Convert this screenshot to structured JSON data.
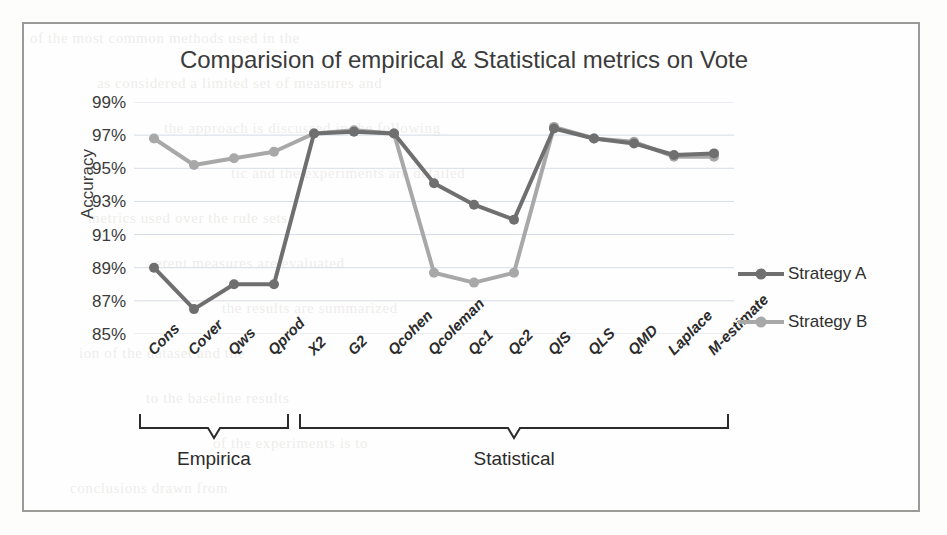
{
  "figure": {
    "title": "Comparision of empirical & Statistical metrics on Vote",
    "y_axis_label": "Accuracy",
    "group_labels": {
      "empirical": "Empirica",
      "statistical": "Statistical"
    },
    "legend": {
      "series_a": "Strategy A",
      "series_b": "Strategy B"
    },
    "colors": {
      "series_a": "#6f6f6f",
      "series_b": "#a8a8a8",
      "gridline": "#d6dce6",
      "frame": "#9a9a97",
      "text": "#3b3b3b"
    }
  },
  "background_text": {
    "lines": [
      "of the most common methods used in the",
      "as considered a limited set of measures and",
      "the approach is discussed in the following",
      "tic and the experiments are detailed",
      "metrics used over the rule sets",
      "erent measures are evaluated",
      "the results are summarized",
      "ion of the dataset and the",
      "to the baseline results",
      "of the experiments is to",
      "conclusions drawn from"
    ]
  },
  "chart_data": {
    "type": "line",
    "title": "Comparision of empirical & Statistical metrics on Vote",
    "xlabel": "",
    "ylabel": "Accuracy",
    "ylim": [
      85,
      99
    ],
    "yticks": [
      85,
      87,
      89,
      91,
      93,
      95,
      97,
      99
    ],
    "ytick_labels": [
      "85%",
      "87%",
      "89%",
      "91%",
      "93%",
      "95%",
      "97%",
      "99%"
    ],
    "grid": true,
    "legend_position": "right",
    "categories": [
      "Cons",
      "Cover",
      "Qws",
      "Qprod",
      "X2",
      "G2",
      "Qcohen",
      "Qcoleman",
      "Qc1",
      "Qc2",
      "QIS",
      "QLS",
      "QMD",
      "Laplace",
      "M-estimate"
    ],
    "category_groups": [
      {
        "label": "Empirica",
        "members": [
          "Cons",
          "Cover",
          "Qws",
          "Qprod"
        ]
      },
      {
        "label": "Statistical",
        "members": [
          "X2",
          "G2",
          "Qcohen",
          "Qcoleman",
          "Qc1",
          "Qc2",
          "QIS",
          "QLS",
          "QMD",
          "Laplace",
          "M-estimate"
        ]
      }
    ],
    "series": [
      {
        "name": "Strategy A",
        "color": "#6f6f6f",
        "values": [
          89.0,
          86.5,
          88.0,
          88.0,
          97.1,
          97.2,
          97.1,
          94.1,
          92.8,
          91.9,
          97.4,
          96.8,
          96.5,
          95.8,
          95.9
        ]
      },
      {
        "name": "Strategy B",
        "color": "#a8a8a8",
        "values": [
          96.8,
          95.2,
          95.6,
          96.0,
          97.1,
          97.3,
          97.1,
          88.7,
          88.1,
          88.7,
          97.5,
          96.8,
          96.6,
          95.7,
          95.7
        ]
      }
    ]
  }
}
